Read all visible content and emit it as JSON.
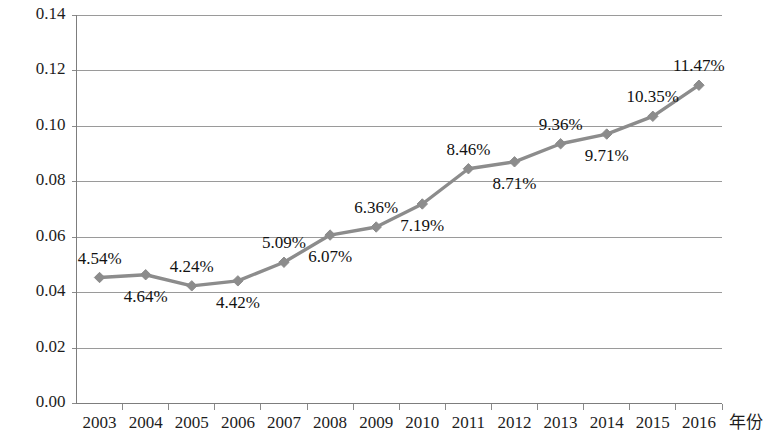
{
  "chart_data": {
    "type": "line",
    "title": "",
    "subtitle": "",
    "xlabel": "年份",
    "ylabel": "",
    "categories": [
      "2003",
      "2004",
      "2005",
      "2006",
      "2007",
      "2008",
      "2009",
      "2010",
      "2011",
      "2012",
      "2013",
      "2014",
      "2015",
      "2016"
    ],
    "values": [
      0.0454,
      0.0464,
      0.0424,
      0.0442,
      0.0509,
      0.0607,
      0.0636,
      0.0719,
      0.0846,
      0.0871,
      0.0936,
      0.0971,
      0.1035,
      0.1147
    ],
    "point_labels": [
      "4.54%",
      "4.64%",
      "4.24%",
      "4.42%",
      "5.09%",
      "6.07%",
      "6.36%",
      "7.19%",
      "8.46%",
      "8.71%",
      "9.36%",
      "9.71%",
      "10.35%",
      "11.47%"
    ],
    "label_positions": [
      "above",
      "below",
      "above",
      "below",
      "above",
      "below",
      "above",
      "below",
      "above",
      "below",
      "above",
      "below",
      "above",
      "above"
    ],
    "ylim": [
      0.0,
      0.14
    ],
    "ytick_labels": [
      "0.14",
      "0.12",
      "0.10",
      "0.08",
      "0.06",
      "0.04",
      "0.02",
      "0.00"
    ],
    "ytick_values": [
      0.14,
      0.12,
      0.1,
      0.08,
      0.06,
      0.04,
      0.02,
      0.0
    ],
    "grid": true,
    "legend": false,
    "legend_position": "none",
    "series_name": "",
    "marker": "diamond",
    "colors": {
      "line": "#8c8c8c",
      "marker": "#8c8c8c",
      "grid": "#9a9a9a",
      "axis": "#7d7d7d",
      "text": "#1d1d1d",
      "background": "#ffffff"
    }
  }
}
